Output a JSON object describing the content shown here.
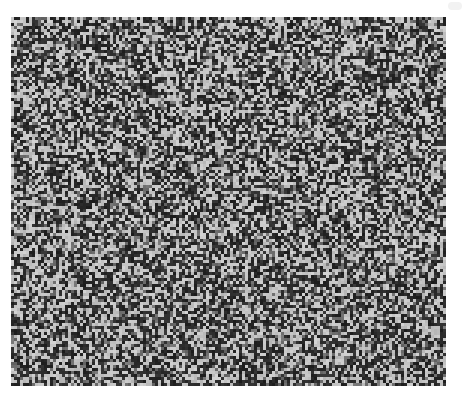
{
  "image": {
    "description": "Random grayscale noise field on a white background",
    "palette": {
      "background": "#ffffff",
      "dark": "#2a2a2a",
      "mid": "#6e6e6e",
      "light": "#c4c4c4"
    },
    "noise_seed": 1337
  }
}
